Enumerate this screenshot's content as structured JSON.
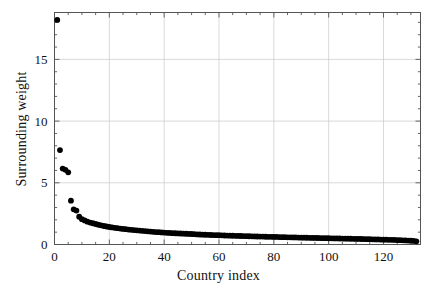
{
  "chart_data": {
    "type": "scatter",
    "title": "",
    "xlabel": "Country index",
    "ylabel": "Surrounding weight",
    "xlim": [
      0,
      133.5
    ],
    "ylim": [
      0,
      18.8
    ],
    "xticks": [
      0,
      20,
      40,
      60,
      80,
      100,
      120
    ],
    "yticks": [
      0,
      5,
      10,
      15
    ],
    "xtick_labels": [
      "0",
      "20",
      "40",
      "60",
      "80",
      "100",
      "120"
    ],
    "ytick_labels": [
      "0",
      "5",
      "10",
      "15"
    ],
    "minor_ticks": true,
    "grid": true,
    "grid_color": "#c8c8c8",
    "marker": "circle",
    "marker_color": "#000000",
    "marker_size": 4.0,
    "legend": null,
    "series": [
      {
        "name": "Surrounding weight",
        "x": [
          1,
          2,
          3,
          4,
          5,
          6,
          7,
          8,
          9,
          10,
          11,
          12,
          13,
          14,
          15,
          16,
          17,
          18,
          19,
          20,
          21,
          22,
          23,
          24,
          25,
          26,
          27,
          28,
          29,
          30,
          31,
          32,
          33,
          34,
          35,
          36,
          37,
          38,
          39,
          40,
          41,
          42,
          43,
          44,
          45,
          46,
          47,
          48,
          49,
          50,
          51,
          52,
          53,
          54,
          55,
          56,
          57,
          58,
          59,
          60,
          61,
          62,
          63,
          64,
          65,
          66,
          67,
          68,
          69,
          70,
          71,
          72,
          73,
          74,
          75,
          76,
          77,
          78,
          79,
          80,
          81,
          82,
          83,
          84,
          85,
          86,
          87,
          88,
          89,
          90,
          91,
          92,
          93,
          94,
          95,
          96,
          97,
          98,
          99,
          100,
          101,
          102,
          103,
          104,
          105,
          106,
          107,
          108,
          109,
          110,
          111,
          112,
          113,
          114,
          115,
          116,
          117,
          118,
          119,
          120,
          121,
          122,
          123,
          124,
          125,
          126,
          127,
          128,
          129,
          130,
          131,
          132
        ],
        "y": [
          18.2,
          7.65,
          6.15,
          6.05,
          5.85,
          3.55,
          2.85,
          2.75,
          2.25,
          2.05,
          1.95,
          1.85,
          1.78,
          1.72,
          1.66,
          1.6,
          1.55,
          1.5,
          1.46,
          1.42,
          1.38,
          1.35,
          1.32,
          1.29,
          1.26,
          1.24,
          1.21,
          1.19,
          1.17,
          1.15,
          1.13,
          1.11,
          1.09,
          1.07,
          1.05,
          1.03,
          1.01,
          1.0,
          0.98,
          0.97,
          0.95,
          0.94,
          0.92,
          0.91,
          0.9,
          0.89,
          0.88,
          0.87,
          0.86,
          0.85,
          0.84,
          0.82,
          0.81,
          0.8,
          0.79,
          0.78,
          0.77,
          0.76,
          0.755,
          0.75,
          0.74,
          0.73,
          0.72,
          0.715,
          0.71,
          0.7,
          0.695,
          0.69,
          0.68,
          0.675,
          0.67,
          0.66,
          0.655,
          0.65,
          0.645,
          0.64,
          0.63,
          0.625,
          0.62,
          0.615,
          0.61,
          0.6,
          0.595,
          0.59,
          0.585,
          0.58,
          0.575,
          0.57,
          0.56,
          0.555,
          0.55,
          0.545,
          0.54,
          0.535,
          0.53,
          0.525,
          0.52,
          0.515,
          0.51,
          0.505,
          0.5,
          0.495,
          0.49,
          0.485,
          0.48,
          0.475,
          0.47,
          0.465,
          0.46,
          0.455,
          0.45,
          0.445,
          0.44,
          0.435,
          0.43,
          0.42,
          0.415,
          0.41,
          0.4,
          0.395,
          0.39,
          0.38,
          0.375,
          0.37,
          0.36,
          0.35,
          0.34,
          0.33,
          0.32,
          0.31,
          0.29,
          0.26
        ]
      }
    ]
  },
  "axes": {
    "x_axis_label": "Country index",
    "y_axis_label": "Surrounding weight"
  }
}
